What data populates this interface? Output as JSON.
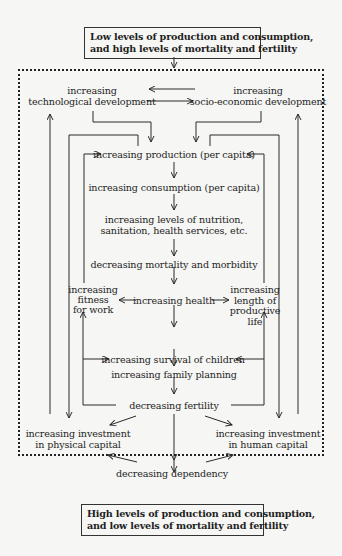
{
  "diagram": {
    "top_box": {
      "line1": "Low levels of production and consumption,",
      "line2": "and high levels of mortality and fertility"
    },
    "bottom_box": {
      "line1": "High levels of production and consumption,",
      "line2": "and low levels of mortality and fertility"
    },
    "nodes": {
      "tech_dev": {
        "line1": "increasing",
        "line2": "technological development"
      },
      "socio_dev": {
        "line1": "increasing",
        "line2": "socio-economic development"
      },
      "production": "increasing production  (per capita)",
      "consumption": "increasing consumption  (per capita)",
      "nutrition": {
        "line1": "increasing levels of nutrition,",
        "line2": "sanitation, health services, etc."
      },
      "mortality": "decreasing mortality and morbidity",
      "health": "increasing health",
      "fitness": {
        "line1": "increasing",
        "line2": "fitness",
        "line3": "for work"
      },
      "length": {
        "line1": "increasing",
        "line2": "length of",
        "line3": "productive",
        "line4": "life"
      },
      "survival": "increasing survival of children",
      "family_planning": "increasing family planning",
      "fertility": "decreasing fertility",
      "physical_capital": {
        "line1": "increasing investment",
        "line2": "in physical capital"
      },
      "human_capital": {
        "line1": "increasing investment",
        "line2": "in human capital"
      },
      "dependency": "decreasing dependency"
    },
    "colors": {
      "line": "#2a2a2a",
      "background": "#f6f6f4"
    }
  }
}
